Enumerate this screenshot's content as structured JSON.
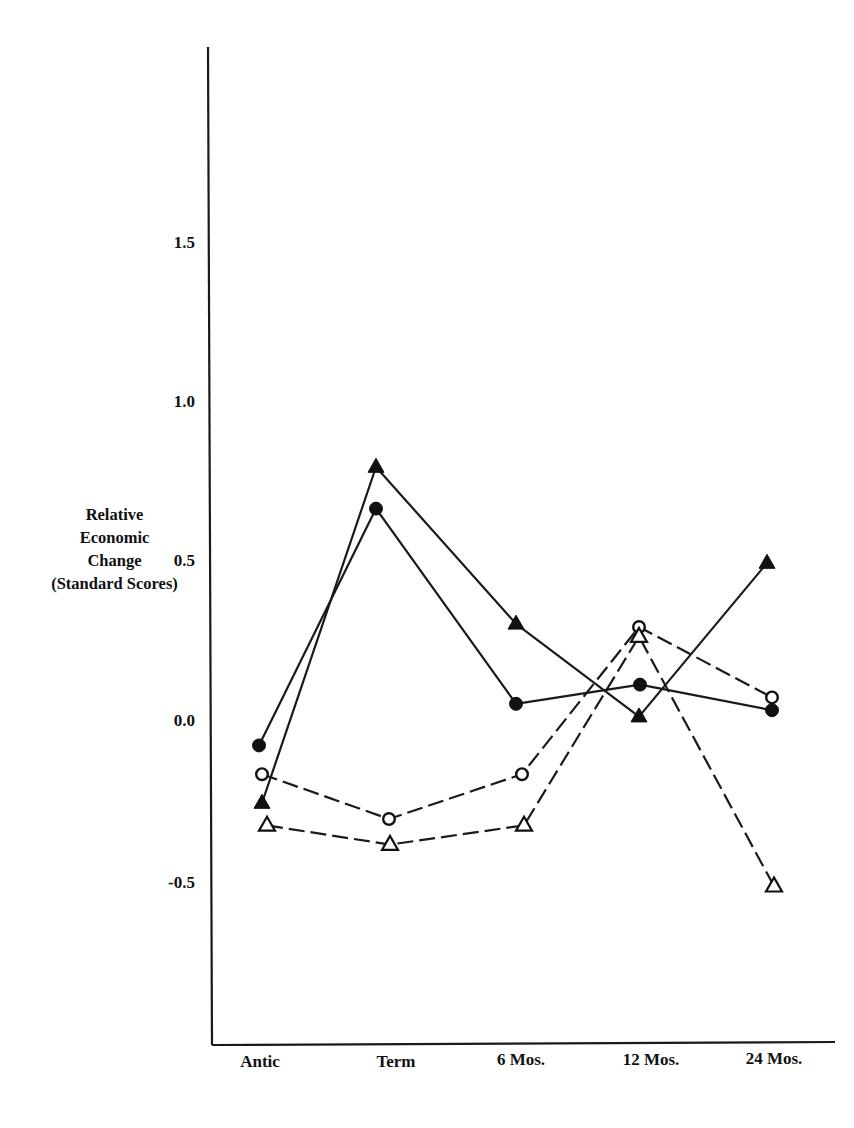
{
  "chart_data": {
    "type": "line",
    "title": "",
    "xlabel": "",
    "ylabel": "Relative Economic Change (Standard Scores)",
    "ylabel_lines": [
      "Relative",
      "Economic",
      "Change",
      "(Standard Scores)"
    ],
    "categories": [
      "Antic",
      "Term",
      "6 Mos.",
      "12 Mos.",
      "24 Mos."
    ],
    "yticks": [
      "1.5",
      "1.0",
      "0.5",
      "0.0",
      "-0.5"
    ],
    "ylim": [
      -0.8,
      2.1
    ],
    "grid": false,
    "legend": "none",
    "series": [
      {
        "name": "filled-triangle-solid",
        "marker": "filled-triangle",
        "line": "solid",
        "values": [
          -0.25,
          0.8,
          0.31,
          0.02,
          0.5
        ],
        "x_px": [
          262,
          376,
          516,
          639,
          767
        ]
      },
      {
        "name": "filled-circle-solid",
        "marker": "filled-circle",
        "line": "solid",
        "values": [
          -0.07,
          0.67,
          0.06,
          0.12,
          0.04
        ],
        "x_px": [
          259,
          376,
          516,
          640,
          772
        ]
      },
      {
        "name": "open-circle-dashed",
        "marker": "open-circle",
        "line": "dashed",
        "values": [
          -0.16,
          -0.3,
          -0.16,
          0.3,
          0.08
        ],
        "x_px": [
          262,
          389,
          522,
          639,
          772
        ]
      },
      {
        "name": "open-triangle-dashed",
        "marker": "open-triangle",
        "line": "dashed",
        "values": [
          -0.32,
          -0.38,
          -0.32,
          0.27,
          -0.51
        ],
        "x_px": [
          267,
          390,
          524,
          639,
          774
        ]
      }
    ]
  }
}
